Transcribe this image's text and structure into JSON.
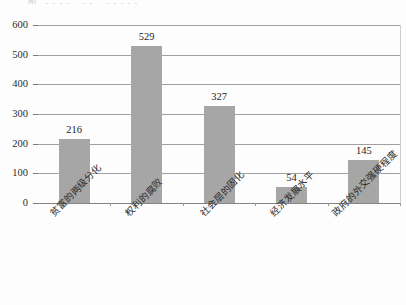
{
  "chart_data": {
    "type": "bar",
    "title": "",
    "xlabel": "",
    "ylabel": "",
    "ylim": [
      0,
      600
    ],
    "ytick_values": [
      0,
      100,
      200,
      300,
      400,
      500,
      600
    ],
    "ytick_labels": [
      "0",
      "100",
      "200",
      "300",
      "400",
      "500",
      "600"
    ],
    "grid": true,
    "legend": false,
    "categories": [
      "贫富的两级分化",
      "权利的腐败",
      "社会层的固化",
      "经济发展水平",
      "政府的外交强硬程度"
    ],
    "values": [
      216,
      529,
      327,
      54,
      145
    ],
    "value_labels": [
      "216",
      "529",
      "327",
      "54",
      "145"
    ],
    "bar_color": "#a6a6a6",
    "gridline_color": "#8f8f8f",
    "axis_color": "#6e6e6e",
    "text_color": "#242424",
    "background_color": "#fdfdfd"
  },
  "page": {
    "clipped_title": "图 ．．．．  ．． ．．．．．"
  }
}
